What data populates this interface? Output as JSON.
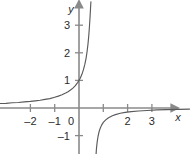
{
  "chart_data": {
    "type": "line",
    "title": "",
    "xlabel": "x",
    "ylabel": "y",
    "xlim": [
      -3.3,
      4.6
    ],
    "ylim": [
      -1.65,
      3.85
    ],
    "grid": false,
    "legend": null,
    "x_ticks": [
      -2,
      -1,
      0,
      1,
      2,
      3
    ],
    "x_tick_labels": [
      "–2",
      "–1",
      "0",
      "",
      "2",
      "3"
    ],
    "y_ticks": [
      -1,
      1,
      2,
      3
    ],
    "y_tick_labels": [
      "–1",
      "1",
      "2",
      "3"
    ],
    "axis_color": "#8a8a8a",
    "curve_color": "#5a5a5a",
    "text_color": "#2b2b2b",
    "background": "#ffffff",
    "asymptotes": {
      "vertical_x": 0.65,
      "horizontal_y": 0
    },
    "series": [
      {
        "name": "upper-left-branch",
        "points": [
          [
            -3.3,
            0.16
          ],
          [
            -3.0,
            0.17
          ],
          [
            -2.75,
            0.19
          ],
          [
            -2.5,
            0.2
          ],
          [
            -2.25,
            0.22
          ],
          [
            -2.0,
            0.24
          ],
          [
            -1.8,
            0.26
          ],
          [
            -1.6,
            0.28
          ],
          [
            -1.4,
            0.31
          ],
          [
            -1.2,
            0.34
          ],
          [
            -1.0,
            0.39
          ],
          [
            -0.85,
            0.43
          ],
          [
            -0.7,
            0.48
          ],
          [
            -0.55,
            0.54
          ],
          [
            -0.45,
            0.59
          ],
          [
            -0.35,
            0.65
          ],
          [
            -0.25,
            0.72
          ],
          [
            -0.15,
            0.81
          ],
          [
            -0.05,
            0.93
          ],
          [
            0.0,
            1.0
          ],
          [
            0.05,
            1.08
          ],
          [
            0.12,
            1.22
          ],
          [
            0.18,
            1.38
          ],
          [
            0.24,
            1.58
          ],
          [
            0.29,
            1.8
          ],
          [
            0.33,
            2.03
          ],
          [
            0.37,
            2.32
          ],
          [
            0.4,
            2.6
          ],
          [
            0.43,
            2.95
          ],
          [
            0.455,
            3.3
          ],
          [
            0.475,
            3.62
          ],
          [
            0.49,
            3.85
          ]
        ]
      },
      {
        "name": "lower-right-branch",
        "points": [
          [
            0.7,
            -1.7
          ],
          [
            0.72,
            -1.45
          ],
          [
            0.75,
            -1.22
          ],
          [
            0.78,
            -1.05
          ],
          [
            0.82,
            -0.88
          ],
          [
            0.87,
            -0.74
          ],
          [
            0.93,
            -0.62
          ],
          [
            1.0,
            -0.52
          ],
          [
            1.1,
            -0.43
          ],
          [
            1.2,
            -0.36
          ],
          [
            1.35,
            -0.29
          ],
          [
            1.5,
            -0.24
          ],
          [
            1.7,
            -0.19
          ],
          [
            1.9,
            -0.16
          ],
          [
            2.15,
            -0.13
          ],
          [
            2.45,
            -0.11
          ],
          [
            2.8,
            -0.09
          ],
          [
            3.2,
            -0.07
          ],
          [
            3.6,
            -0.06
          ],
          [
            4.1,
            -0.05
          ],
          [
            4.55,
            -0.04
          ]
        ]
      }
    ]
  }
}
